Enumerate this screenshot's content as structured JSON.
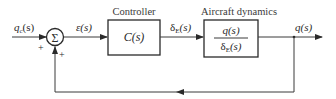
{
  "diagram": {
    "type": "feedback-block-diagram",
    "input": {
      "label": "q",
      "subscript": "c",
      "arg": "(s)"
    },
    "summing_junction": {
      "symbol": "Σ",
      "signs": {
        "reference": "+",
        "feedback": "+"
      }
    },
    "error_signal": {
      "label": "ε(s)"
    },
    "controller": {
      "title": "Controller",
      "transfer_function": "C(s)"
    },
    "control_signal": {
      "label": "δ",
      "subscript": "E",
      "arg": "(s)"
    },
    "plant": {
      "title": "Aircraft dynamics",
      "numerator": "q(s)",
      "denominator": {
        "label": "δ",
        "subscript": "E",
        "arg": "(s)"
      }
    },
    "output": {
      "label": "q(s)"
    },
    "feedback": {
      "type": "unity",
      "direction": "right-to-left"
    }
  },
  "colors": {
    "ink": "#2a2a2a",
    "background": "#ffffff"
  }
}
